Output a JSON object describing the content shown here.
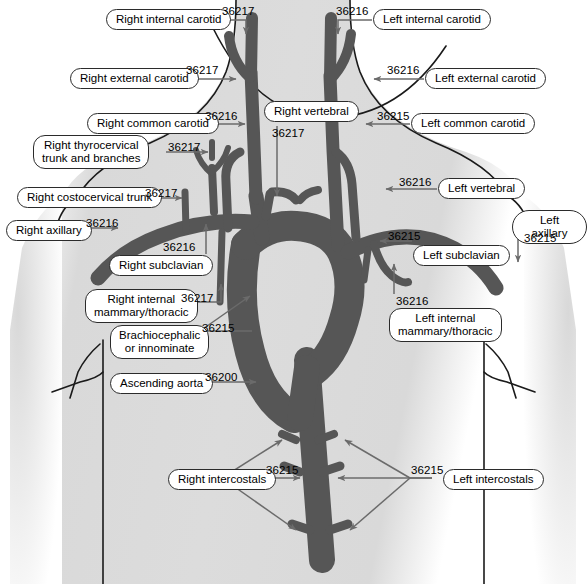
{
  "figure": {
    "vessel_color": "#565656",
    "body_fill": "#dcdcdc",
    "outline_color": "#1a1a1a",
    "leader_color": "#6b6b6b",
    "pill_fill": "#ffffff",
    "pill_border": "#2b2b2b"
  },
  "labels": [
    {
      "id": "right-internal-carotid",
      "text": "Right internal carotid",
      "code": "36217"
    },
    {
      "id": "left-internal-carotid",
      "text": "Left internal carotid",
      "code": "36216"
    },
    {
      "id": "right-external-carotid",
      "text": "Right external carotid",
      "code": "36217"
    },
    {
      "id": "left-external-carotid",
      "text": "Left external carotid",
      "code": "36216"
    },
    {
      "id": "right-common-carotid",
      "text": "Right common carotid",
      "code": "36216"
    },
    {
      "id": "left-common-carotid",
      "text": "Left common carotid",
      "code": "36215"
    },
    {
      "id": "right-vertebral",
      "text": "Right vertebral",
      "code": "36217"
    },
    {
      "id": "left-vertebral",
      "text": "Left vertebral",
      "code": "36216"
    },
    {
      "id": "right-thyrocervical",
      "text": "Right thyrocervical\ntrunk and branches",
      "code": "36217"
    },
    {
      "id": "right-costocervical",
      "text": "Right costocervical trunk",
      "code": "36217"
    },
    {
      "id": "right-axillary",
      "text": "Right axillary",
      "code": "36216"
    },
    {
      "id": "left-axillary",
      "text": "Left axillary",
      "code": "36215"
    },
    {
      "id": "right-subclavian",
      "text": "Right subclavian",
      "code": "36216"
    },
    {
      "id": "left-subclavian",
      "text": "Left subclavian",
      "code": "36215"
    },
    {
      "id": "right-internal-mammary",
      "text": "Right internal\nmammary/thoracic",
      "code": "36217"
    },
    {
      "id": "left-internal-mammary",
      "text": "Left internal\nmammary/thoracic",
      "code": "36216"
    },
    {
      "id": "brachiocephalic",
      "text": "Brachiocephalic\nor innominate",
      "code": "36215"
    },
    {
      "id": "ascending-aorta",
      "text": "Ascending aorta",
      "code": "36200"
    },
    {
      "id": "right-intercostals",
      "text": "Right intercostals",
      "code": "36215"
    },
    {
      "id": "left-intercostals",
      "text": "Left intercostals",
      "code": "36215"
    }
  ]
}
